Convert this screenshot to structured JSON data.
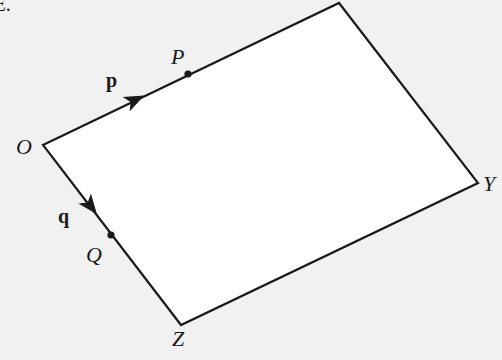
{
  "diagram": {
    "type": "parallelogram-vectors",
    "colors": {
      "background": "#f1f1f1",
      "shape_fill": "#ffffff",
      "stroke": "#1a1a1a"
    },
    "vertices": {
      "O": {
        "label": "O",
        "x": 43,
        "y": 145
      },
      "top": {
        "x": 339,
        "y": 3
      },
      "Y": {
        "label": "Y",
        "x": 478,
        "y": 183
      },
      "Z": {
        "label": "Z",
        "x": 181,
        "y": 325
      }
    },
    "points": {
      "P": {
        "label": "P",
        "x": 188,
        "y": 74
      },
      "Q": {
        "label": "Q",
        "x": 111,
        "y": 235
      }
    },
    "vectors": {
      "p": {
        "label": "p",
        "arrow_x": 135,
        "arrow_y": 100
      },
      "q": {
        "label": "q",
        "arrow_x": 90,
        "arrow_y": 207
      }
    },
    "truncated_text": "E."
  }
}
